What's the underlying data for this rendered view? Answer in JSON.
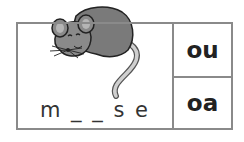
{
  "card": {
    "word": "m _ _ s e",
    "image": "mouse-illustration",
    "options": [
      "ou",
      "oa"
    ]
  }
}
